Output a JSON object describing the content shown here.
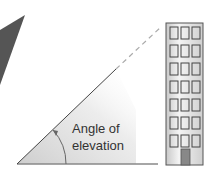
{
  "diagram": {
    "title": "Angle of elevation",
    "label_line1": "Angle of",
    "label_line2": "elevation",
    "building": {
      "window_columns": 3,
      "window_rows": 7,
      "has_door": true
    },
    "colors": {
      "dark_shape": "#555555",
      "building_fill_light": "#f2f2f2",
      "building_fill_dark": "#c8c8c8",
      "building_stroke": "#555555",
      "window_stroke": "#444444",
      "door_fill": "#888888",
      "sight_line": "#444444",
      "ground_line": "#888888",
      "angle_shade": "#d4d4d4",
      "label": "#333333"
    }
  }
}
